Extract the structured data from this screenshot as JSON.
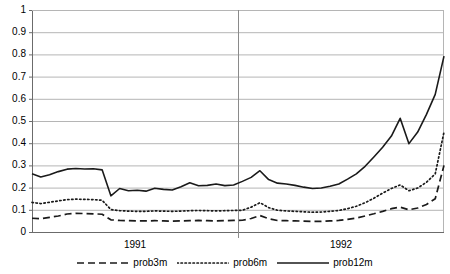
{
  "chart_data": {
    "type": "line",
    "title": "",
    "xlabel": "",
    "ylabel": "",
    "ylim": [
      0,
      1
    ],
    "grid": true,
    "grid_axis": "y",
    "legend_position": "bottom",
    "yticks": [
      0,
      0.1,
      0.2,
      0.3,
      0.4,
      0.5,
      0.6,
      0.7,
      0.8,
      0.9,
      1
    ],
    "ytick_labels": [
      "0",
      "0.1",
      "0.2",
      "0.3",
      "0.4",
      "0.5",
      "0.6",
      "0.7",
      "0.8",
      "0.9",
      "1"
    ],
    "xtick_labels": [
      "1991",
      "1992"
    ],
    "x_group_boundaries": [
      0.5
    ],
    "x_count": 48,
    "series": [
      {
        "name": "prob3m",
        "style": "dashed",
        "color": "#1a1a1a",
        "values": [
          0.062,
          0.06,
          0.066,
          0.072,
          0.081,
          0.084,
          0.083,
          0.082,
          0.08,
          0.055,
          0.052,
          0.051,
          0.05,
          0.05,
          0.051,
          0.05,
          0.049,
          0.05,
          0.051,
          0.052,
          0.051,
          0.05,
          0.051,
          0.052,
          0.053,
          0.061,
          0.074,
          0.06,
          0.052,
          0.051,
          0.05,
          0.049,
          0.048,
          0.048,
          0.05,
          0.052,
          0.057,
          0.063,
          0.072,
          0.082,
          0.093,
          0.105,
          0.112,
          0.1,
          0.108,
          0.124,
          0.15,
          0.3
        ]
      },
      {
        "name": "prob6m",
        "style": "dotted",
        "color": "#1a1a1a",
        "values": [
          0.133,
          0.128,
          0.134,
          0.14,
          0.146,
          0.148,
          0.147,
          0.146,
          0.143,
          0.101,
          0.096,
          0.094,
          0.093,
          0.093,
          0.095,
          0.094,
          0.093,
          0.094,
          0.096,
          0.097,
          0.096,
          0.095,
          0.096,
          0.097,
          0.098,
          0.112,
          0.132,
          0.11,
          0.098,
          0.095,
          0.093,
          0.091,
          0.089,
          0.09,
          0.093,
          0.097,
          0.105,
          0.116,
          0.132,
          0.152,
          0.175,
          0.196,
          0.212,
          0.186,
          0.198,
          0.224,
          0.262,
          0.45
        ]
      },
      {
        "name": "prob12m",
        "style": "solid",
        "color": "#1a1a1a",
        "values": [
          0.262,
          0.248,
          0.258,
          0.272,
          0.283,
          0.286,
          0.284,
          0.285,
          0.28,
          0.163,
          0.196,
          0.186,
          0.188,
          0.184,
          0.197,
          0.192,
          0.189,
          0.204,
          0.222,
          0.208,
          0.21,
          0.216,
          0.209,
          0.212,
          0.228,
          0.246,
          0.276,
          0.236,
          0.22,
          0.216,
          0.21,
          0.202,
          0.196,
          0.198,
          0.206,
          0.216,
          0.238,
          0.262,
          0.296,
          0.338,
          0.382,
          0.432,
          0.512,
          0.398,
          0.45,
          0.53,
          0.62,
          0.792
        ]
      }
    ]
  },
  "legend": {
    "items": [
      {
        "label": "prob3m",
        "style": "dashed"
      },
      {
        "label": "prob6m",
        "style": "dotted"
      },
      {
        "label": "prob12m",
        "style": "solid"
      }
    ]
  },
  "axes": {
    "y_labels": [
      "1",
      "0.9",
      "0.8",
      "0.7",
      "0.6",
      "0.5",
      "0.4",
      "0.3",
      "0.2",
      "0.1",
      "0"
    ],
    "x_labels": [
      "1991",
      "1992"
    ]
  }
}
